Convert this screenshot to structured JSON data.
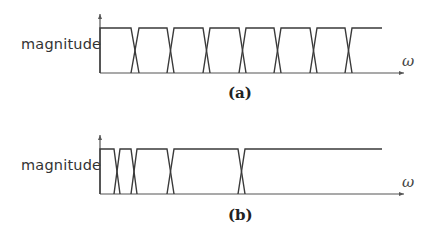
{
  "panels": [
    {
      "id": "a",
      "caption": "(a)",
      "ylabel": "magnitude",
      "xlabel": "ω",
      "axis": {
        "x0": 100,
        "top": 28,
        "base": 73,
        "arrow_end": 404,
        "yaxis_top": 14
      },
      "line_end": 382,
      "transitions": [
        {
          "a": 131,
          "b": 139
        },
        {
          "a": 167,
          "b": 174
        },
        {
          "a": 203,
          "b": 210
        },
        {
          "a": 239,
          "b": 246
        },
        {
          "a": 274,
          "b": 281
        },
        {
          "a": 310,
          "b": 317
        },
        {
          "a": 345,
          "b": 352
        }
      ]
    },
    {
      "id": "b",
      "caption": "(b)",
      "ylabel": "magnitude",
      "xlabel": "ω",
      "axis": {
        "x0": 100,
        "top": 149,
        "base": 194,
        "arrow_end": 404,
        "yaxis_top": 135
      },
      "line_end": 382,
      "transitions": [
        {
          "a": 114,
          "b": 120
        },
        {
          "a": 131,
          "b": 137
        },
        {
          "a": 167,
          "b": 174
        },
        {
          "a": 238,
          "b": 245
        }
      ]
    }
  ],
  "colors": {
    "line": "#3a3a3a",
    "axis": "#555555"
  }
}
